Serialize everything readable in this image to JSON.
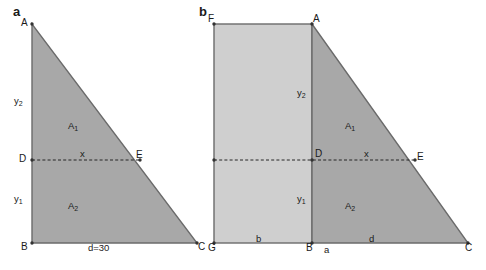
{
  "figure": {
    "background": "#ffffff",
    "stroke_color": "#6b6b6b",
    "dash_color": "#262626",
    "fill_dark": "#a8a8a8",
    "fill_light": "#cfcfcf",
    "text_color": "#1a1a1a",
    "width": 486,
    "height": 270
  },
  "panel_a": {
    "letter": "a",
    "vertices": {
      "A": "A",
      "B": "B",
      "C": "C",
      "D": "D",
      "E": "E"
    },
    "labels": {
      "y2": "y",
      "y2_sub": "2",
      "y1": "y",
      "y1_sub": "1",
      "A1": "A",
      "A1_sub": "1",
      "A2": "A",
      "A2_sub": "2",
      "x": "x",
      "base": "d=30"
    }
  },
  "panel_b": {
    "letter": "b",
    "vertices": {
      "F": "F",
      "A": "A",
      "G": "G",
      "B": "B",
      "C": "C",
      "D": "D",
      "E": "E"
    },
    "labels": {
      "y2": "y",
      "y2_sub": "2",
      "y1": "y",
      "y1_sub": "1",
      "A1": "A",
      "A1_sub": "1",
      "A2": "A",
      "A2_sub": "2",
      "x": "x",
      "b": "b",
      "a": "a",
      "d": "d"
    }
  }
}
